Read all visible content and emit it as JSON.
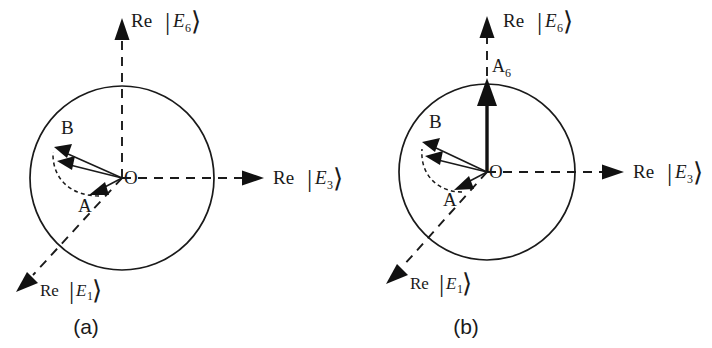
{
  "figure": {
    "background_color": "#ffffff",
    "ink_color": "#1a1a1a"
  },
  "panels": [
    {
      "id": "a",
      "caption": "(a)",
      "origin_label": "O",
      "axes": [
        {
          "id": "e6",
          "re": "Re",
          "bar": "|",
          "field": "E",
          "sub": "6",
          "ket": "⟩",
          "direction": "up"
        },
        {
          "id": "e3",
          "re": "Re",
          "bar": "|",
          "field": "E",
          "sub": "3",
          "ket": "⟩",
          "direction": "right"
        },
        {
          "id": "e1",
          "re": "Re",
          "bar": "|",
          "field": "E",
          "sub": "1",
          "ket": "⟩",
          "direction": "down-left"
        }
      ],
      "vectors": [
        {
          "id": "a",
          "label": "A",
          "style": "thin",
          "note": "short vector from O toward lower left"
        },
        {
          "id": "mid",
          "label": "",
          "style": "thin",
          "note": "intermediate vector from O toward upper left"
        },
        {
          "id": "b",
          "label": "B",
          "style": "thin",
          "note": "long vector from O toward upper left"
        }
      ],
      "arc": {
        "style": "dashed",
        "note": "dashed arc sweeping from A through the intermediate vector to B"
      }
    },
    {
      "id": "b",
      "caption": "(b)",
      "origin_label": "O",
      "axes": [
        {
          "id": "e6",
          "re": "Re",
          "bar": "|",
          "field": "E",
          "sub": "6",
          "ket": "⟩",
          "direction": "up"
        },
        {
          "id": "e3",
          "re": "Re",
          "bar": "|",
          "field": "E",
          "sub": "3",
          "ket": "⟩",
          "direction": "right"
        },
        {
          "id": "e1",
          "re": "Re",
          "bar": "|",
          "field": "E",
          "sub": "1",
          "ket": "⟩",
          "direction": "down-left"
        }
      ],
      "vectors": [
        {
          "id": "a6",
          "label": "A",
          "sub": "6",
          "style": "bold",
          "note": "bold vertical vector from O up to the circle along the Re|E6> axis"
        },
        {
          "id": "a",
          "label": "A",
          "style": "thin",
          "note": "short vector from O toward lower left"
        },
        {
          "id": "mid",
          "label": "",
          "style": "thin",
          "note": "intermediate vector from O toward upper left"
        },
        {
          "id": "b",
          "label": "B",
          "style": "thin",
          "note": "long vector from O toward upper left"
        }
      ],
      "arc": {
        "style": "dashed",
        "note": "dashed arc sweeping from A through the intermediate vector to B"
      }
    }
  ]
}
